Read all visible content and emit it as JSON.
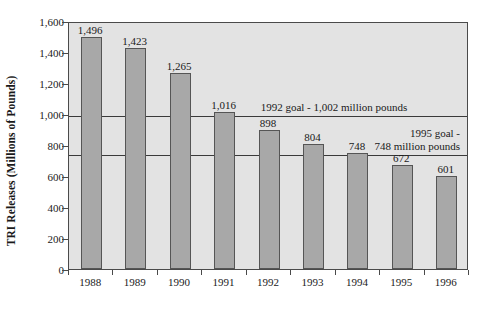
{
  "chart_data": {
    "type": "bar",
    "title": "",
    "subtitle": "",
    "xlabel": "",
    "ylabel": "TRI Releases (Millions of Pounds)",
    "categories": [
      "1988",
      "1989",
      "1990",
      "1991",
      "1992",
      "1993",
      "1994",
      "1995",
      "1996"
    ],
    "values": [
      1496,
      1423,
      1265,
      1016,
      898,
      804,
      748,
      672,
      601
    ],
    "value_labels": [
      "1,496",
      "1,423",
      "1,265",
      "1,016",
      "898",
      "804",
      "748",
      "672",
      "601"
    ],
    "ylim": [
      0,
      1600
    ],
    "ytick_values": [
      0,
      200,
      400,
      600,
      800,
      1000,
      1200,
      1400,
      1600
    ],
    "ytick_labels": [
      "0",
      "200",
      "400",
      "600",
      "800",
      "1,000",
      "1,200",
      "1,400",
      "1,600"
    ],
    "grid": false,
    "legend": "none",
    "bar_color": "#a8a8a8",
    "bar_border_color": "#555555",
    "plot_background": "#e3e3e3",
    "axis_color": "#4a4a4a",
    "annotations": [
      {
        "id": "goal_1992",
        "text": "1992 goal - 1,002 million pounds",
        "lines": [
          "1992 goal - 1,002 million pounds"
        ],
        "value": 1002,
        "line_color": "#3a3a3a"
      },
      {
        "id": "goal_1995",
        "text": "1995 goal - 748 million pounds",
        "lines": [
          "1995 goal -",
          "748 million pounds"
        ],
        "value": 748,
        "line_color": "#3a3a3a"
      }
    ]
  }
}
